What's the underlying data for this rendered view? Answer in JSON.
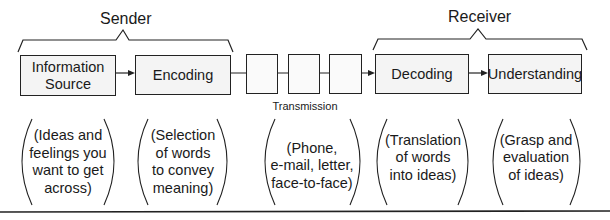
{
  "groups": {
    "sender": "Sender",
    "receiver": "Receiver"
  },
  "stages": [
    {
      "id": "information-source",
      "label": "Information Source",
      "lines": [
        "Information",
        "Source"
      ],
      "description_lines": [
        "(Ideas and",
        "feelings you",
        "want to get",
        "across)"
      ]
    },
    {
      "id": "encoding",
      "label": "Encoding",
      "lines": [
        "Encoding"
      ],
      "description_lines": [
        "(Selection",
        "of words",
        "to convey",
        "meaning)"
      ]
    },
    {
      "id": "transmission",
      "label": "Transmission",
      "lines": [
        "Transmission"
      ],
      "description_lines": [
        "(Phone,",
        "e-mail, letter,",
        "face-to-face)"
      ]
    },
    {
      "id": "decoding",
      "label": "Decoding",
      "lines": [
        "Decoding"
      ],
      "description_lines": [
        "(Translation",
        "of words",
        "into ideas)"
      ]
    },
    {
      "id": "understanding",
      "label": "Understanding",
      "lines": [
        "Understanding"
      ],
      "description_lines": [
        "(Grasp and",
        "evaluation",
        "of ideas)"
      ]
    }
  ],
  "colors": {
    "stroke": "#222222",
    "box_fill": "#f4f4f4",
    "background": "#ffffff"
  }
}
